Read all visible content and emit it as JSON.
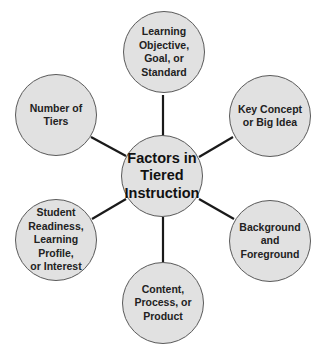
{
  "diagram": {
    "title": "Factors in Tiered Instruction",
    "center": {
      "label": "Factors in\nTiered\nInstruction",
      "cx": 162,
      "cy": 176
    },
    "nodes": [
      {
        "id": "learning-objective",
        "label": "Learning\nObjective,\nGoal, or\nStandard",
        "cx": 164,
        "cy": 52
      },
      {
        "id": "key-concept",
        "label": "Key Concept\nor Big Idea",
        "cx": 270,
        "cy": 116
      },
      {
        "id": "background-foreground",
        "label": "Background\nand\nForeground",
        "cx": 270,
        "cy": 241
      },
      {
        "id": "content-process-product",
        "label": "Content,\nProcess, or\nProduct",
        "cx": 163,
        "cy": 303
      },
      {
        "id": "student-readiness",
        "label": "Student\nReadiness,\nLearning\nProfile,\nor Interest",
        "cx": 56,
        "cy": 240
      },
      {
        "id": "number-of-tiers",
        "label": "Number of\nTiers",
        "cx": 56,
        "cy": 115
      }
    ],
    "colors": {
      "node_fill": "#e1e1e1",
      "node_border": "#5a5a5a",
      "connector": "#1a1a1a",
      "text": "#222222"
    }
  }
}
